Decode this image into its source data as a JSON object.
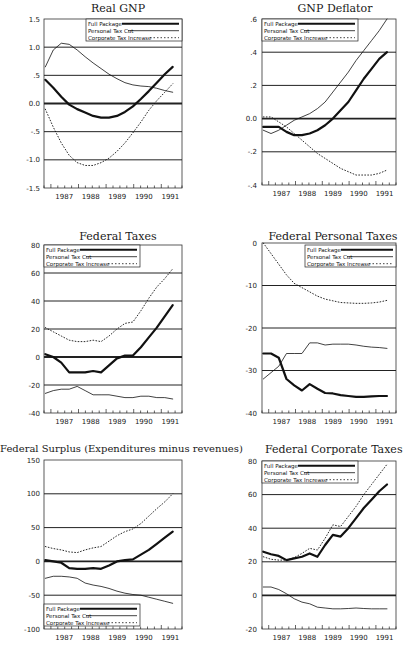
{
  "chart_data": [
    {
      "type": "line",
      "title": "Real GNP",
      "xlabel": "",
      "ylabel": "",
      "x": [
        1986.6,
        1986.9,
        1987.2,
        1987.5,
        1987.8,
        1988.1,
        1988.4,
        1988.7,
        1989.0,
        1989.3,
        1989.6,
        1989.9,
        1990.2,
        1990.5,
        1990.8,
        1991.1,
        1991.4
      ],
      "x_ticks": [
        "1987",
        "1988",
        "1989",
        "1990",
        "1991"
      ],
      "y_ticks": [
        "1.5",
        "1.0",
        ".5",
        "0.0",
        "-.5",
        "-1.0",
        "-1.5"
      ],
      "ylim": [
        -1.5,
        1.5
      ],
      "grid": "horizontal",
      "legend_position": "upper right",
      "series": [
        {
          "name": "Full Package",
          "style": "thick solid",
          "values": [
            0.42,
            0.28,
            0.12,
            -0.02,
            -0.1,
            -0.16,
            -0.22,
            -0.25,
            -0.25,
            -0.22,
            -0.15,
            -0.05,
            0.08,
            0.22,
            0.37,
            0.52,
            0.65
          ]
        },
        {
          "name": "Personal Tax Cut",
          "style": "thin solid",
          "values": [
            0.65,
            0.95,
            1.07,
            1.05,
            0.95,
            0.83,
            0.72,
            0.62,
            0.52,
            0.44,
            0.37,
            0.33,
            0.31,
            0.3,
            0.27,
            0.23,
            0.2
          ]
        },
        {
          "name": "Corporate Tax Increase",
          "style": "dotted",
          "values": [
            -0.1,
            -0.42,
            -0.7,
            -0.92,
            -1.05,
            -1.1,
            -1.1,
            -1.05,
            -0.97,
            -0.85,
            -0.7,
            -0.52,
            -0.33,
            -0.12,
            0.05,
            0.2,
            0.35
          ]
        }
      ]
    },
    {
      "type": "line",
      "title": "GNP Deflator",
      "xlabel": "",
      "ylabel": "",
      "x": [
        1986.6,
        1986.9,
        1987.2,
        1987.5,
        1987.8,
        1988.1,
        1988.4,
        1988.7,
        1989.0,
        1989.3,
        1989.6,
        1989.9,
        1990.2,
        1990.5,
        1990.8,
        1991.1,
        1991.4
      ],
      "x_ticks": [
        "1987",
        "1988",
        "1989",
        "1990",
        "1991"
      ],
      "y_ticks": [
        ".6",
        ".4",
        ".2",
        "0.0",
        "-.2",
        "-.4"
      ],
      "ylim": [
        -0.4,
        0.6
      ],
      "grid": "horizontal",
      "legend_position": "upper left",
      "series": [
        {
          "name": "Full Package",
          "style": "thick solid",
          "values": [
            -0.05,
            -0.05,
            -0.05,
            -0.08,
            -0.1,
            -0.1,
            -0.09,
            -0.07,
            -0.04,
            0.0,
            0.05,
            0.1,
            0.17,
            0.24,
            0.3,
            0.36,
            0.4
          ]
        },
        {
          "name": "Personal Tax Cut",
          "style": "thin solid",
          "values": [
            -0.07,
            -0.09,
            -0.07,
            -0.04,
            -0.01,
            0.01,
            0.03,
            0.06,
            0.1,
            0.16,
            0.22,
            0.28,
            0.35,
            0.41,
            0.47,
            0.53,
            0.6
          ]
        },
        {
          "name": "Corporate Tax Increase",
          "style": "dotted",
          "values": [
            0.01,
            0.01,
            -0.02,
            -0.05,
            -0.09,
            -0.13,
            -0.17,
            -0.21,
            -0.24,
            -0.27,
            -0.3,
            -0.32,
            -0.34,
            -0.34,
            -0.34,
            -0.33,
            -0.31
          ]
        }
      ]
    },
    {
      "type": "line",
      "title": "Federal Taxes",
      "xlabel": "",
      "ylabel": "",
      "x": [
        1986.6,
        1986.9,
        1987.2,
        1987.5,
        1987.8,
        1988.1,
        1988.4,
        1988.7,
        1989.0,
        1989.3,
        1989.6,
        1989.9,
        1990.2,
        1990.5,
        1990.8,
        1991.1,
        1991.4
      ],
      "x_ticks": [
        "1987",
        "1988",
        "1989",
        "1990",
        "1991"
      ],
      "y_ticks": [
        "80",
        "60",
        "40",
        "20",
        "0",
        "-20",
        "-40"
      ],
      "ylim": [
        -40,
        80
      ],
      "grid": "horizontal",
      "legend_position": "upper left",
      "series": [
        {
          "name": "Full Package",
          "style": "thick solid",
          "values": [
            2,
            0,
            -4,
            -11,
            -11,
            -11,
            -10,
            -11,
            -6,
            -1,
            1,
            1,
            7,
            14,
            21,
            29,
            37
          ]
        },
        {
          "name": "Personal Tax Cut",
          "style": "thin solid",
          "values": [
            -26,
            -24,
            -23,
            -23,
            -21,
            -24,
            -27,
            -27,
            -27,
            -28,
            -29,
            -29,
            -28,
            -28,
            -29,
            -29,
            -30
          ]
        },
        {
          "name": "Corporate Tax Increase",
          "style": "dotted",
          "values": [
            21,
            18,
            15,
            12,
            11,
            11,
            12,
            11,
            15,
            20,
            24,
            25,
            33,
            42,
            50,
            56,
            63
          ]
        }
      ]
    },
    {
      "type": "line",
      "title": "Federal Personal Taxes",
      "xlabel": "",
      "ylabel": "",
      "x": [
        1986.6,
        1986.9,
        1987.2,
        1987.5,
        1987.8,
        1988.1,
        1988.4,
        1988.7,
        1989.0,
        1989.3,
        1989.6,
        1989.9,
        1990.2,
        1990.5,
        1990.8,
        1991.1,
        1991.4
      ],
      "x_ticks": [
        "1987",
        "1988",
        "1989",
        "1990",
        "1991"
      ],
      "y_ticks": [
        "0",
        "-10",
        "-20",
        "-30",
        "-40"
      ],
      "ylim": [
        -40,
        0
      ],
      "grid": "horizontal",
      "legend_position": "upper right",
      "series": [
        {
          "name": "Full Package",
          "style": "thick solid",
          "values": [
            -26,
            -26,
            -27,
            -32,
            -33.5,
            -34.7,
            -33.2,
            -34.3,
            -35.3,
            -35.4,
            -35.8,
            -36,
            -36.2,
            -36.2,
            -36.1,
            -36,
            -36
          ]
        },
        {
          "name": "Personal Tax Cut",
          "style": "thin solid",
          "values": [
            -32,
            -30.5,
            -29,
            -26,
            -26,
            -26,
            -23.5,
            -23.5,
            -24,
            -23.8,
            -23.8,
            -23.8,
            -24,
            -24.3,
            -24.5,
            -24.6,
            -24.8
          ]
        },
        {
          "name": "Corporate Tax Increase",
          "style": "dotted",
          "values": [
            0,
            -2.5,
            -5,
            -7.5,
            -9.5,
            -10.5,
            -11.5,
            -12.5,
            -13.2,
            -13.6,
            -14,
            -14.1,
            -14.2,
            -14.2,
            -14.1,
            -13.9,
            -13.5
          ]
        }
      ]
    },
    {
      "type": "line",
      "title": "Federal Surplus (Expenditures minus revenues)",
      "xlabel": "",
      "ylabel": "",
      "x": [
        1986.6,
        1986.9,
        1987.2,
        1987.5,
        1987.8,
        1988.1,
        1988.4,
        1988.7,
        1989.0,
        1989.3,
        1989.6,
        1989.9,
        1990.2,
        1990.5,
        1990.8,
        1991.1,
        1991.4
      ],
      "x_ticks": [
        "1987",
        "1988",
        "1989",
        "1990",
        "1991"
      ],
      "y_ticks": [
        "150",
        "100",
        "50",
        "0",
        "-50",
        "-100"
      ],
      "ylim": [
        -100,
        150
      ],
      "grid": "horizontal",
      "legend_position": "lower left",
      "series": [
        {
          "name": "Full Package",
          "style": "thick solid",
          "values": [
            2,
            0,
            -2,
            -10,
            -11,
            -11,
            -10,
            -11,
            -6,
            0,
            2,
            3,
            10,
            17,
            26,
            35,
            44
          ]
        },
        {
          "name": "Personal Tax Cut",
          "style": "thin solid",
          "values": [
            -25,
            -22,
            -22,
            -23,
            -25,
            -32,
            -35,
            -37,
            -40,
            -44,
            -47,
            -49,
            -50,
            -53,
            -56,
            -59,
            -62
          ]
        },
        {
          "name": "Corporate Tax Increase",
          "style": "dotted",
          "values": [
            22,
            19,
            17,
            14,
            13,
            17,
            20,
            22,
            30,
            38,
            44,
            48,
            56,
            67,
            78,
            88,
            100
          ]
        }
      ]
    },
    {
      "type": "line",
      "title": "Federal Corporate Taxes",
      "xlabel": "",
      "ylabel": "",
      "x": [
        1986.6,
        1986.9,
        1987.2,
        1987.5,
        1987.8,
        1988.1,
        1988.4,
        1988.7,
        1989.0,
        1989.3,
        1989.6,
        1989.9,
        1990.2,
        1990.5,
        1990.8,
        1991.1,
        1991.4
      ],
      "x_ticks": [
        "1987",
        "1988",
        "1989",
        "1990",
        "1991"
      ],
      "y_ticks": [
        "80",
        "60",
        "40",
        "20",
        "0",
        "-20"
      ],
      "ylim": [
        -20,
        80
      ],
      "grid": "horizontal",
      "legend_position": "upper left",
      "series": [
        {
          "name": "Full Package",
          "style": "thick solid",
          "values": [
            26,
            24.5,
            23.5,
            21,
            22,
            23,
            25,
            23,
            30,
            36,
            35,
            40,
            46,
            52,
            57,
            62,
            66
          ]
        },
        {
          "name": "Personal Tax Cut",
          "style": "thin solid",
          "values": [
            5,
            5,
            3.5,
            1,
            -2,
            -4,
            -5,
            -7,
            -7.5,
            -8,
            -8,
            -7.8,
            -7.5,
            -7.8,
            -8,
            -8,
            -8
          ]
        },
        {
          "name": "Corporate Tax Increase",
          "style": "dotted",
          "values": [
            23,
            21.5,
            21,
            21,
            22.5,
            25,
            28,
            27,
            34,
            42,
            41,
            47,
            53,
            60,
            66,
            72,
            78
          ]
        }
      ]
    }
  ],
  "charts": [
    {
      "title": "Real GNP"
    },
    {
      "title": "GNP Deflator"
    },
    {
      "title": "Federal Taxes"
    },
    {
      "title": "Federal Personal Taxes"
    },
    {
      "title": "Federal Surplus (Expenditures minus revenues)"
    },
    {
      "title": "Federal Corporate Taxes"
    }
  ],
  "legend": {
    "full_package": "Full Package",
    "personal_tax_cut": "Personal Tax Cut",
    "corporate_tax_increase": "Corporate Tax Increase"
  },
  "years": [
    "1987",
    "1988",
    "1989",
    "1990",
    "1991"
  ],
  "colors": {
    "ink": "#1a1a1a",
    "background": "#ffffff"
  }
}
